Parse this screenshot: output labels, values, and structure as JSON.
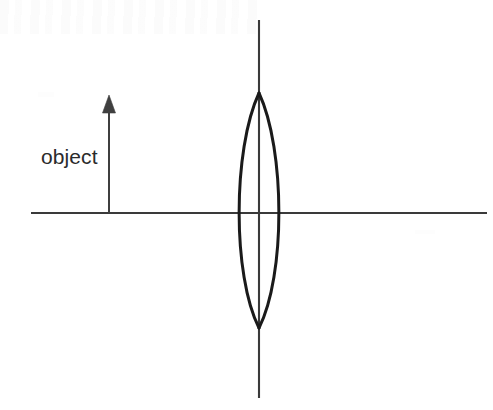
{
  "diagram": {
    "type": "optics-ray-diagram",
    "canvas": {
      "width": 493,
      "height": 410,
      "background": "#ffffff"
    },
    "labels": {
      "object": "object"
    },
    "colors": {
      "axis": "#3a3a3a",
      "lens": "#1a1a1a",
      "arrow": "#3f3f3f",
      "text": "#2b2b2b",
      "background": "#ffffff"
    },
    "elements": {
      "optical_axis": {
        "name": "horizontal optical axis",
        "x1": 31,
        "y1": 213,
        "x2": 487,
        "y2": 213,
        "stroke_width": 1.8
      },
      "principal_axis": {
        "name": "vertical principal axis",
        "x1": 259,
        "y1": 20,
        "x2": 259,
        "y2": 398,
        "stroke_width": 2.1
      },
      "lens": {
        "name": "biconvex converging lens",
        "center_x": 259,
        "top_vertex_y": 93,
        "bottom_vertex_y": 328,
        "half_width": 26,
        "stroke_width": 3.0,
        "left_arc": "M 259 93 C 233 150 233 276 259 328",
        "right_arc": "M 259 93 C 285 150 285 276 259 328"
      },
      "object_arrow": {
        "name": "object arrow",
        "x": 109,
        "base_y": 213,
        "tip_y": 95,
        "shaft_width": 2.0,
        "head_width": 13,
        "head_height": 18
      }
    }
  }
}
